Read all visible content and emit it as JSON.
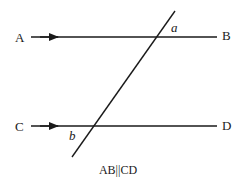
{
  "diagram": {
    "points": {
      "A": "A",
      "B": "B",
      "C": "C",
      "D": "D"
    },
    "angles": {
      "a": "a",
      "b": "b"
    },
    "caption": "AB||CD",
    "colors": {
      "line": "#1a1a1a",
      "background": "#ffffff"
    }
  }
}
